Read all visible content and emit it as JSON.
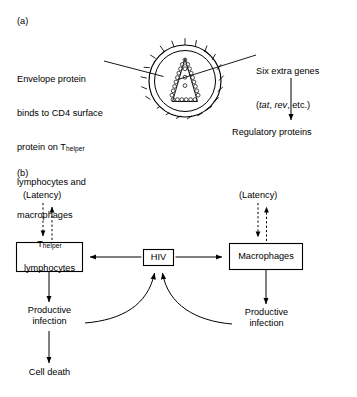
{
  "figure": {
    "background_color": "#ffffff",
    "line_color": "#000000",
    "width": 357,
    "height": 397
  },
  "panel_a": {
    "label": "(a)",
    "left_caption": {
      "line1": "Envelope protein",
      "line2": "binds to CD4 surface",
      "line3_prefix": "protein on T",
      "line3_subscript": "helper",
      "line4": "lymphocytes and",
      "line5": "macrophages"
    },
    "right_caption": {
      "line1": "Six extra genes",
      "line2_open": "(",
      "line2_gene1": "tat",
      "line2_sep": ", ",
      "line2_gene2": "rev",
      "line2_tail": ", etc.)"
    },
    "downstream_label": "Regulatory proteins",
    "virion": {
      "name": "hiv-virion-icon",
      "envelope_outer_radius": 30,
      "envelope_inner_radius": 24,
      "spike_count": 18,
      "capsid_shape": "cone",
      "capsid_bead_count": 30
    }
  },
  "panel_b": {
    "label": "(b)",
    "nodes": {
      "hiv": "HIV",
      "t_helper_prefix": "T",
      "t_helper_subscript": "helper",
      "t_helper_line2": "lymphocytes",
      "macrophages": "Macrophages"
    },
    "latency_left": "(Latency)",
    "latency_right": "(Latency)",
    "productive_left": "Productive\ninfection",
    "productive_right": "Productive\ninfection",
    "cell_death": "Cell death",
    "edges": [
      {
        "from": "HIV",
        "to": "T-helper lymphocytes",
        "style": "solid-arrow"
      },
      {
        "from": "HIV",
        "to": "Macrophages",
        "style": "solid-arrow"
      },
      {
        "from": "T-helper lymphocytes",
        "to": "Latency",
        "style": "dashed-arrow-up"
      },
      {
        "from": "Latency",
        "to": "T-helper lymphocytes",
        "style": "dashed-arrow-down"
      },
      {
        "from": "Macrophages",
        "to": "Latency",
        "style": "dashed-arrow-up"
      },
      {
        "from": "Latency",
        "to": "Macrophages",
        "style": "dashed-arrow-down"
      },
      {
        "from": "T-helper lymphocytes",
        "to": "Productive infection",
        "style": "solid-arrow"
      },
      {
        "from": "Macrophages",
        "to": "Productive infection",
        "style": "solid-arrow"
      },
      {
        "from": "Productive infection (left)",
        "to": "HIV",
        "style": "curved-arrow"
      },
      {
        "from": "Productive infection (right)",
        "to": "HIV",
        "style": "curved-arrow"
      },
      {
        "from": "Productive infection (left)",
        "to": "Cell death",
        "style": "solid-arrow"
      }
    ]
  }
}
